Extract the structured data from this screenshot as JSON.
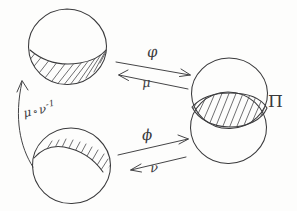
{
  "diagram": {
    "kind": "hand-drawn-mathematical-sketch",
    "background_color": "#fdfdfc",
    "ink_color": "#3a3a3c",
    "width": 297,
    "height": 211
  },
  "shapes": {
    "top_left_disk": {
      "name": "top-left-circle",
      "shaded_region": "lower-segment",
      "hatch_direction": "lower-left-to-upper-right"
    },
    "bottom_left_disk": {
      "name": "bottom-left-circle",
      "shaded_region": "upper-segment",
      "hatch_direction": "lower-left-to-upper-right"
    },
    "right_disks": {
      "name": "overlapping-circles",
      "count": 2,
      "shaded_region": "intersection-lens",
      "hatch_direction": "lower-left-to-upper-right"
    }
  },
  "labels": {
    "phi_top": "φ",
    "mu_top": "μ",
    "phi_bottom": "ϕ",
    "nu_bottom": "ν",
    "transition_mu": "μ",
    "transition_compose": "∘",
    "transition_nu": "ν",
    "transition_exponent": "-1",
    "pi": "Π"
  },
  "arrows": [
    {
      "name": "arrow-phi-top",
      "label": "φ",
      "direction": "right",
      "from": "top-left-circle",
      "to": "overlapping-circles"
    },
    {
      "name": "arrow-mu-top",
      "label": "μ",
      "direction": "left",
      "from": "overlapping-circles",
      "to": "top-left-circle"
    },
    {
      "name": "arrow-phi-bottom",
      "label": "ϕ",
      "direction": "right",
      "from": "bottom-left-circle",
      "to": "overlapping-circles"
    },
    {
      "name": "arrow-nu-bottom",
      "label": "ν",
      "direction": "left",
      "from": "overlapping-circles",
      "to": "bottom-left-circle"
    },
    {
      "name": "arrow-transition-curved",
      "label": "μ ∘ ν⁻¹",
      "direction": "up",
      "from": "bottom-left-circle",
      "to": "top-left-circle"
    }
  ]
}
